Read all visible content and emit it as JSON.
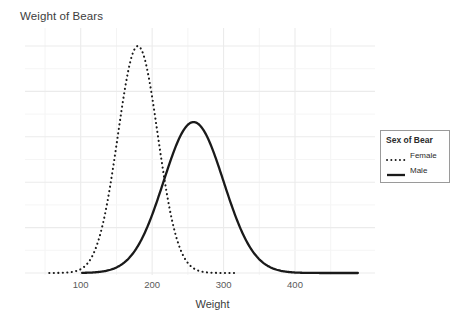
{
  "chart_data": {
    "type": "line",
    "title": "Weight of Bears",
    "xlabel": "Weight",
    "ylabel": "",
    "xlim": [
      22,
      512
    ],
    "ylim": [
      0,
      1
    ],
    "grid": true,
    "grid_major_x": [
      100,
      200,
      300,
      400
    ],
    "grid_minor_x": [
      50,
      150,
      250,
      350,
      450
    ],
    "xticks": [
      100,
      200,
      300,
      400
    ],
    "xtick_labels": [
      "100",
      "200",
      "300",
      "400"
    ],
    "legend_position": "right",
    "legend_title": "Sex of Bear",
    "series": [
      {
        "name": "Female",
        "linestyle": "dotted",
        "color": "#1a1a1a",
        "mean": 180,
        "sigma": 28,
        "peak_density": 1.0,
        "x_start": 56,
        "x_end": 318
      },
      {
        "name": "Male",
        "linestyle": "solid",
        "color": "#1a1a1a",
        "mean": 258,
        "sigma": 42,
        "peak_density": 0.665,
        "x_start": 102,
        "x_end": 488
      }
    ]
  },
  "plot": {
    "panel_background": "#ffffff",
    "gridline_color": "#ececec",
    "axis_text_color": "#5a5a5a"
  },
  "legend": {
    "title": "Sex of Bear",
    "items": [
      {
        "label": "Female",
        "style": "dotted"
      },
      {
        "label": "Male",
        "style": "solid"
      }
    ]
  }
}
